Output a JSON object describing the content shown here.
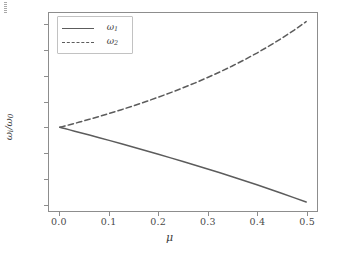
{
  "chart_data": {
    "type": "line",
    "title": "",
    "xlabel": "μ",
    "ylabel": "ωi/ω0",
    "ylabel_main": "ω",
    "ylabel_sub1": "i",
    "ylabel_den": "ω",
    "ylabel_sub2": "0",
    "xlim": [
      -0.022,
      0.522
    ],
    "ylim": [
      0.672,
      1.448
    ],
    "grid": false,
    "legend_position": "upper left",
    "xticks": [
      0.0,
      0.1,
      0.2,
      0.3,
      0.4,
      0.5
    ],
    "xtick_labels": [
      "0.0",
      "0.1",
      "0.2",
      "0.3",
      "0.4",
      "0.5"
    ],
    "yticks": [
      0.7,
      0.8,
      0.9,
      1.0,
      1.1,
      1.2,
      1.3,
      1.4
    ],
    "ytick_labels": [
      "0.7",
      "0.8",
      "0.9",
      "1.0",
      "1.1",
      "1.2",
      "1.3",
      "1.4"
    ],
    "series": [
      {
        "name": "ω₁",
        "legend_label": "ω",
        "legend_sub": "1",
        "style": "solid",
        "color": "#5c5c5c",
        "x": [
          0.0,
          0.005,
          0.01,
          0.02,
          0.03,
          0.04,
          0.05,
          0.06,
          0.08,
          0.1,
          0.125,
          0.15,
          0.175,
          0.2,
          0.225,
          0.25,
          0.275,
          0.3,
          0.325,
          0.35,
          0.375,
          0.4,
          0.425,
          0.45,
          0.475,
          0.5
        ],
        "values": [
          1.0,
          0.9975,
          0.995,
          0.99,
          0.9849,
          0.9798,
          0.9747,
          0.9695,
          0.9592,
          0.9487,
          0.9354,
          0.922,
          0.9083,
          0.8944,
          0.8803,
          0.866,
          0.8515,
          0.8367,
          0.8216,
          0.8062,
          0.7906,
          0.7746,
          0.7583,
          0.7416,
          0.7246,
          0.7071
        ]
      },
      {
        "name": "ω₂",
        "legend_label": "ω",
        "legend_sub": "2",
        "style": "dashed",
        "color": "#5c5c5c",
        "x": [
          0.0,
          0.005,
          0.01,
          0.02,
          0.03,
          0.04,
          0.05,
          0.06,
          0.08,
          0.1,
          0.125,
          0.15,
          0.175,
          0.2,
          0.225,
          0.25,
          0.275,
          0.3,
          0.325,
          0.35,
          0.375,
          0.4,
          0.425,
          0.45,
          0.475,
          0.5
        ],
        "values": [
          1.0,
          1.0025,
          1.005,
          1.0102,
          1.0153,
          1.0206,
          1.026,
          1.0314,
          1.0426,
          1.0541,
          1.069,
          1.0847,
          1.101,
          1.118,
          1.1359,
          1.1547,
          1.1744,
          1.1952,
          1.2172,
          1.2403,
          1.2649,
          1.291,
          1.3188,
          1.3484,
          1.3801,
          1.4142
        ]
      }
    ]
  },
  "legend": {
    "items": [
      {
        "label": "ω",
        "sub": "1",
        "style": "solid"
      },
      {
        "label": "ω",
        "sub": "2",
        "style": "dashed"
      }
    ]
  },
  "axes": {
    "x_label": "μ",
    "y_label_num": "ω",
    "y_label_num_sub": "i",
    "y_label_den": "ω",
    "y_label_den_sub": "0"
  }
}
